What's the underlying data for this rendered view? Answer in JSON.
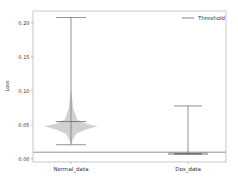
{
  "chart_data": {
    "type": "violin",
    "title": "",
    "xlabel": "",
    "ylabel": "Loss",
    "categories": [
      "Normal_data",
      "Dos_data"
    ],
    "ylim": [
      -0.004,
      0.225
    ],
    "yticks": [
      0.0,
      0.05,
      0.1,
      0.15,
      0.2
    ],
    "ytick_labels": [
      "0.00",
      "0.05",
      "0.10",
      "0.15",
      "0.20"
    ],
    "series": [
      {
        "name": "Normal_data",
        "min": 0.021,
        "max": 0.208,
        "mean": 0.055,
        "mode": 0.048,
        "density_peak_half_width": 0.55
      },
      {
        "name": "Dos_data",
        "min": 0.007,
        "max": 0.078,
        "mean": 0.008,
        "mode": 0.008,
        "density_peak_half_width": 0.4
      }
    ],
    "threshold": 0.01,
    "legend": {
      "entries": [
        "Threshold"
      ],
      "position": "upper right"
    },
    "grid": false
  },
  "legend": {
    "label": "Threshold"
  },
  "axes": {
    "ylabel": "Loss"
  }
}
